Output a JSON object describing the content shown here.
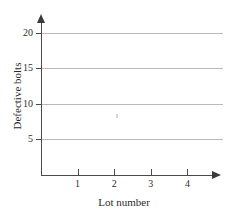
{
  "chart_data": {
    "type": "scatter",
    "title": "",
    "xlabel": "Lot number",
    "ylabel": "Defective bolts",
    "x": [],
    "values": [],
    "series": [],
    "xlim": [
      0,
      4.7
    ],
    "ylim": [
      0,
      21.5
    ],
    "xticks": [
      1,
      2,
      3,
      4
    ],
    "yticks": [
      5,
      10,
      15,
      20
    ],
    "xtick_labels": [
      "1",
      "2",
      "3",
      "4"
    ],
    "ytick_labels": [
      "5",
      "10",
      "15",
      "20"
    ],
    "grid": "horizontal",
    "legend": null,
    "note": "empty axes, no data plotted"
  },
  "figure": {
    "title_remnant": "",
    "axis_color": "#4a4a4a",
    "grid_color": "#b9b9b9",
    "text_color": "#2b2b2b",
    "background": "#ffffff"
  }
}
